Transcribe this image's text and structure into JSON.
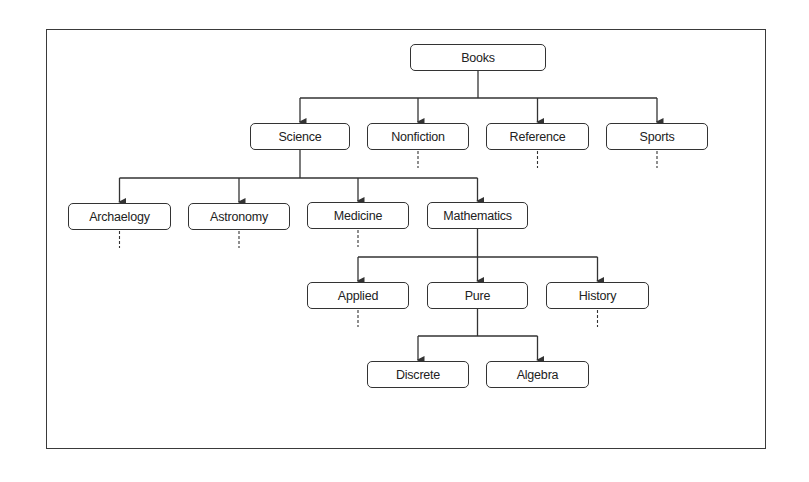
{
  "diagram": {
    "type": "hierarchy-tree",
    "root": "Books",
    "colors": {
      "stroke": "#333333",
      "text": "#222222",
      "background": "#ffffff"
    },
    "nodes": [
      {
        "id": "books",
        "label": "Books",
        "x": 410,
        "y": 44,
        "w": 136
      },
      {
        "id": "science",
        "label": "Science",
        "x": 250,
        "y": 123,
        "w": 100
      },
      {
        "id": "nonfiction",
        "label": "Nonfiction",
        "x": 367,
        "y": 123,
        "w": 102
      },
      {
        "id": "reference",
        "label": "Reference",
        "x": 486,
        "y": 123,
        "w": 103
      },
      {
        "id": "sports",
        "label": "Sports",
        "x": 606,
        "y": 123,
        "w": 102
      },
      {
        "id": "archaeology",
        "label": "Archaelogy",
        "x": 68,
        "y": 203,
        "w": 103
      },
      {
        "id": "astronomy",
        "label": "Astronomy",
        "x": 188,
        "y": 203,
        "w": 102
      },
      {
        "id": "medicine",
        "label": "Medicine",
        "x": 307,
        "y": 202,
        "w": 102
      },
      {
        "id": "mathematics",
        "label": "Mathematics",
        "x": 427,
        "y": 202,
        "w": 101
      },
      {
        "id": "applied",
        "label": "Applied",
        "x": 307,
        "y": 282,
        "w": 102
      },
      {
        "id": "pure",
        "label": "Pure",
        "x": 427,
        "y": 282,
        "w": 101
      },
      {
        "id": "history",
        "label": "History",
        "x": 546,
        "y": 282,
        "w": 103
      },
      {
        "id": "discrete",
        "label": "Discrete",
        "x": 367,
        "y": 361,
        "w": 102
      },
      {
        "id": "algebra",
        "label": "Algebra",
        "x": 486,
        "y": 361,
        "w": 103
      }
    ],
    "edges": [
      {
        "from": "books",
        "to": [
          "science",
          "nonfiction",
          "reference",
          "sports"
        ]
      },
      {
        "from": "science",
        "to": [
          "archaeology",
          "astronomy",
          "medicine",
          "mathematics"
        ]
      },
      {
        "from": "mathematics",
        "to": [
          "applied",
          "pure",
          "history"
        ]
      },
      {
        "from": "pure",
        "to": [
          "discrete",
          "algebra"
        ]
      }
    ],
    "continuation_stubs": [
      "nonfiction",
      "reference",
      "sports",
      "archaeology",
      "astronomy",
      "medicine",
      "applied",
      "history"
    ]
  }
}
